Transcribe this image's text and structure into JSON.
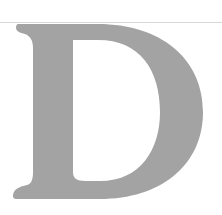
{
  "image": {
    "letter": "D",
    "letter_color": "#a3a3a3",
    "background_color": "#ffffff",
    "rule_color": "#d8d8d8"
  }
}
